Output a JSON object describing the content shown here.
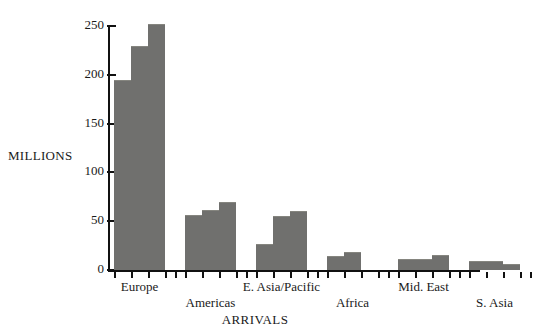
{
  "chart_data": {
    "type": "bar",
    "title": "",
    "xlabel": "ARRIVALS",
    "ylabel": "MILLIONS",
    "ylim": [
      0,
      250
    ],
    "yticks": [
      0,
      50,
      100,
      150,
      200,
      250
    ],
    "grid": false,
    "legend": "none",
    "bar_color": "#70706e",
    "axis_color": "#111111",
    "categories": [
      "Europe",
      "Americas",
      "E. Asia/Pacific",
      "Africa",
      "Mid. East",
      "S. Asia"
    ],
    "series": [
      {
        "name": "bar-1",
        "values": [
          194,
          55,
          26,
          13,
          10,
          8
        ]
      },
      {
        "name": "bar-2",
        "values": [
          228,
          60,
          54,
          17,
          10,
          8
        ]
      },
      {
        "name": "bar-3",
        "values": [
          251,
          69,
          59,
          0,
          14,
          5
        ]
      }
    ],
    "groups": [
      {
        "label": "Europe",
        "values": [
          194,
          228,
          251
        ]
      },
      {
        "label": "Americas",
        "values": [
          55,
          60,
          69
        ]
      },
      {
        "label": "E. Asia/Pacific",
        "values": [
          26,
          54,
          59
        ]
      },
      {
        "label": "Africa",
        "values": [
          13,
          17,
          0
        ]
      },
      {
        "label": "Mid. East",
        "values": [
          10,
          10,
          14
        ]
      },
      {
        "label": "S. Asia",
        "values": [
          8,
          8,
          5
        ]
      }
    ]
  },
  "axes": {
    "y_label": "MILLIONS",
    "x_label": "ARRIVALS",
    "y_ticks": [
      "0",
      "50",
      "100",
      "150",
      "200",
      "250"
    ]
  },
  "category_labels": [
    {
      "text": "Europe",
      "row": "top"
    },
    {
      "text": "Americas",
      "row": "bottom"
    },
    {
      "text": "E. Asia/Pacific",
      "row": "top"
    },
    {
      "text": "Africa",
      "row": "bottom"
    },
    {
      "text": "Mid. East",
      "row": "top"
    },
    {
      "text": "S. Asia",
      "row": "bottom"
    }
  ]
}
